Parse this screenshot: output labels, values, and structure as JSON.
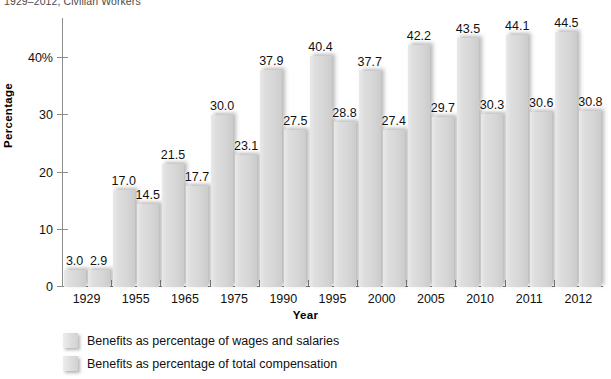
{
  "chart_data": {
    "type": "bar",
    "title": "1929–2012, Civilian Workers",
    "xlabel": "Year",
    "ylabel": "Percentage",
    "ylim": [
      0,
      47
    ],
    "yticks": [
      "0",
      "10",
      "20",
      "30",
      "40%"
    ],
    "ytick_values": [
      0,
      10,
      20,
      30,
      40
    ],
    "grid": false,
    "legend_position": "bottom-left",
    "categories": [
      "1929",
      "1955",
      "1965",
      "1975",
      "1990",
      "1995",
      "2000",
      "2005",
      "2010",
      "2011",
      "2012"
    ],
    "series": [
      {
        "name": "Benefits as percentage of wages and salaries",
        "values": [
          3.0,
          17.0,
          21.5,
          30.0,
          37.9,
          40.4,
          37.7,
          42.2,
          43.5,
          44.1,
          44.5
        ],
        "labels": [
          "3.0",
          "17.0",
          "21.5",
          "30.0",
          "37.9",
          "40.4",
          "37.7",
          "42.2",
          "43.5",
          "44.1",
          "44.5"
        ],
        "color": "#dcdcdc"
      },
      {
        "name": "Benefits as percentage of total compensation",
        "values": [
          2.9,
          14.5,
          17.7,
          23.1,
          27.5,
          28.8,
          27.4,
          29.7,
          30.3,
          30.6,
          30.8
        ],
        "labels": [
          "2.9",
          "14.5",
          "17.7",
          "23.1",
          "27.5",
          "28.8",
          "27.4",
          "29.7",
          "30.3",
          "30.6",
          "30.8"
        ],
        "color": "#d4d4d4"
      }
    ]
  },
  "colors": {
    "bar_light": "#e4e4e4",
    "bar_dark": "#cccccc",
    "axis": "#6f6f6f",
    "text": "#111111"
  }
}
